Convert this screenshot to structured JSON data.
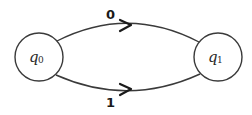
{
  "diagram": {
    "type": "finite-automaton",
    "states": [
      {
        "id": "q0",
        "base": "q",
        "sub": "0"
      },
      {
        "id": "q1",
        "base": "q",
        "sub": "1"
      }
    ],
    "transitions": [
      {
        "from": "q0",
        "to": "q1",
        "label": "0",
        "position": "top"
      },
      {
        "from": "q0",
        "to": "q1",
        "label": "1",
        "position": "bottom"
      }
    ]
  }
}
